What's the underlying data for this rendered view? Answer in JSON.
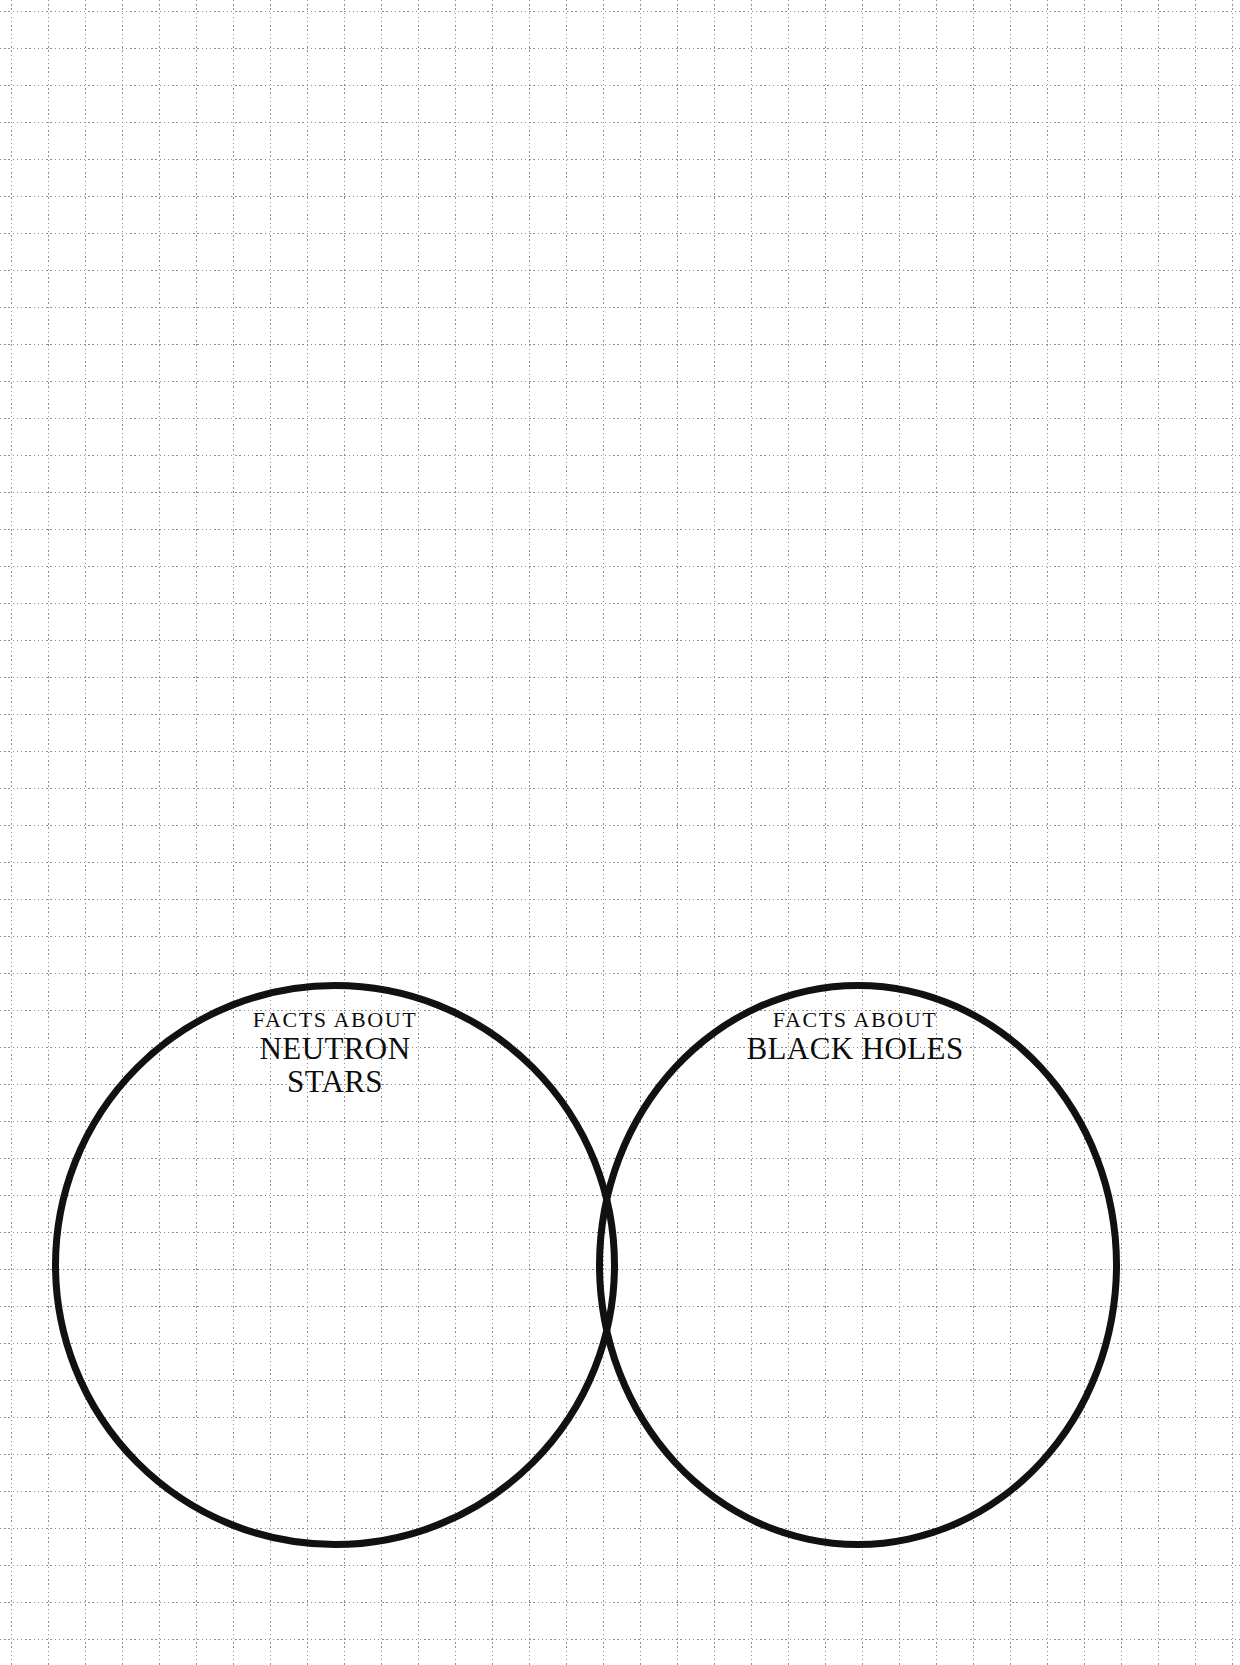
{
  "page": {
    "background_color": "#ffffff",
    "grid": {
      "style": "dotted",
      "color": "#8f8f8f",
      "spacing_px": 37,
      "origin_offset_px": 11
    }
  },
  "venn": {
    "stroke_color": "#111111",
    "stroke_width_px": 7,
    "fill_color": "#ffffff",
    "circles": [
      {
        "id": "left",
        "kicker": "FACTS ABOUT",
        "name_lines": [
          "NEUTRON",
          "STARS"
        ],
        "name": "NEUTRON STARS"
      },
      {
        "id": "right",
        "kicker": "FACTS ABOUT",
        "name_lines": [
          "BLACK HOLES"
        ],
        "name": "BLACK HOLES"
      }
    ]
  }
}
